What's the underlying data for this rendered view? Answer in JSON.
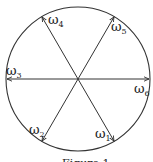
{
  "diagram": {
    "type": "vector-star",
    "circle": {
      "cx": 78,
      "cy": 79,
      "r": 72
    },
    "stroke_color": "#333333",
    "vectors": [
      {
        "id": "w1",
        "symbol": "ω",
        "sub": "1",
        "angle_deg": -60
      },
      {
        "id": "w2",
        "symbol": "ω",
        "sub": "2",
        "angle_deg": -120
      },
      {
        "id": "w3",
        "symbol": "ω",
        "sub": "3",
        "angle_deg": 180
      },
      {
        "id": "w4",
        "symbol": "ω",
        "sub": "4",
        "angle_deg": 120
      },
      {
        "id": "w5",
        "symbol": "ω",
        "sub": "5",
        "angle_deg": 60
      },
      {
        "id": "w6",
        "symbol": "ω",
        "sub": "6",
        "angle_deg": 0
      }
    ],
    "caption": "Figure 1"
  }
}
